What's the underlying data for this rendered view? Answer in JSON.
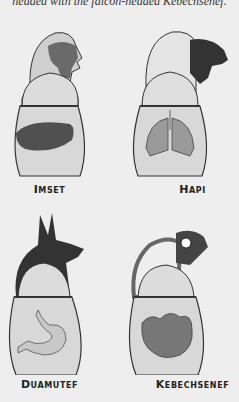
{
  "caption": "headed with the falcon-headed Kebechsenef.",
  "jars": [
    {
      "name": "Imset",
      "head": "human",
      "organ": "liver"
    },
    {
      "name": "Hapi",
      "head": "baboon",
      "organ": "lungs"
    },
    {
      "name": "Duamutef",
      "head": "jackal",
      "organ": "stomach"
    },
    {
      "name": "Kebechsenef",
      "head": "falcon",
      "organ": "intestines"
    }
  ],
  "colors": {
    "background": "#eeeeee",
    "jar_fill": "#d8d8d8",
    "outline": "#333333",
    "dark_head": "#3a3a3a",
    "organ": "#555555"
  }
}
